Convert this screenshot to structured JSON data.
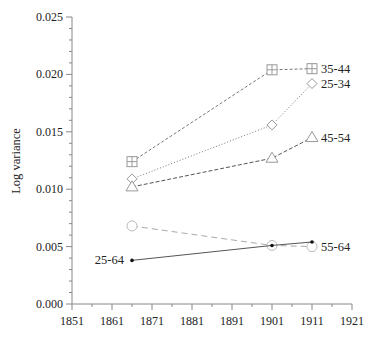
{
  "chart_data": {
    "type": "line",
    "title": "",
    "xlabel": "",
    "ylabel": "Log variance",
    "xlim": [
      1851,
      1921
    ],
    "ylim": [
      0.0,
      0.025
    ],
    "x_ticks": [
      "1851",
      "1861",
      "1871",
      "1881",
      "1891",
      "1901",
      "1911",
      "1921"
    ],
    "y_ticks": [
      "0.000",
      "0.005",
      "0.010",
      "0.015",
      "0.020",
      "0.025"
    ],
    "grid": false,
    "legend": "inline labels at line ends",
    "series": [
      {
        "name": "35-44",
        "marker": "square-cross",
        "line": "dashed",
        "x": [
          1866,
          1901,
          1911
        ],
        "values": [
          0.0124,
          0.0204,
          0.0205
        ],
        "label_at": "end"
      },
      {
        "name": "25-34",
        "marker": "diamond",
        "line": "dotted",
        "x": [
          1866,
          1901,
          1911
        ],
        "values": [
          0.0109,
          0.0156,
          0.0192
        ],
        "label_at": "end"
      },
      {
        "name": "45-54",
        "marker": "triangle",
        "line": "dashed-dark",
        "x": [
          1866,
          1901,
          1911
        ],
        "values": [
          0.0102,
          0.0127,
          0.0145
        ],
        "label_at": "end"
      },
      {
        "name": "55-64",
        "marker": "circle",
        "line": "long-dashed",
        "x": [
          1866,
          1901,
          1911
        ],
        "values": [
          0.0068,
          0.0051,
          0.005
        ],
        "label_at": "end"
      },
      {
        "name": "25-64",
        "marker": "dot",
        "line": "solid",
        "x": [
          1866,
          1901,
          1911
        ],
        "values": [
          0.0038,
          0.0051,
          0.0054
        ],
        "label_at": "start"
      }
    ]
  },
  "colors": {
    "axis": "#888888",
    "series_line": "#777777",
    "marker": "#999999",
    "solid_line": "#555555",
    "dot": "#111111",
    "text": "#222222"
  }
}
